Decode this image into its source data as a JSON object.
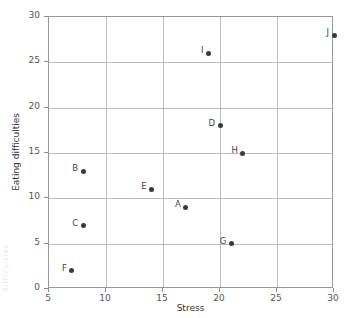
{
  "chart_data": {
    "type": "scatter",
    "title": "",
    "xlabel": "Stress",
    "ylabel": "Eating difficulties",
    "xlim": [
      5,
      30
    ],
    "ylim": [
      0,
      30
    ],
    "xticks": [
      5,
      10,
      15,
      20,
      25,
      30
    ],
    "yticks": [
      0,
      5,
      10,
      15,
      20,
      25,
      30
    ],
    "grid": true,
    "legend": null,
    "point_color": "#3a3a3a",
    "grid_color": "#bdbdbd",
    "axis_color": "#999999",
    "points": [
      {
        "label": "A",
        "x": 17,
        "y": 9
      },
      {
        "label": "B",
        "x": 8,
        "y": 13
      },
      {
        "label": "C",
        "x": 8,
        "y": 7
      },
      {
        "label": "D",
        "x": 20,
        "y": 18
      },
      {
        "label": "E",
        "x": 14,
        "y": 11
      },
      {
        "label": "F",
        "x": 7,
        "y": 2
      },
      {
        "label": "G",
        "x": 21,
        "y": 5
      },
      {
        "label": "H",
        "x": 22,
        "y": 15
      },
      {
        "label": "I",
        "x": 19,
        "y": 26
      },
      {
        "label": "J",
        "x": 30,
        "y": 28
      }
    ]
  },
  "artifact": {
    "edge_text": "difficulties"
  }
}
